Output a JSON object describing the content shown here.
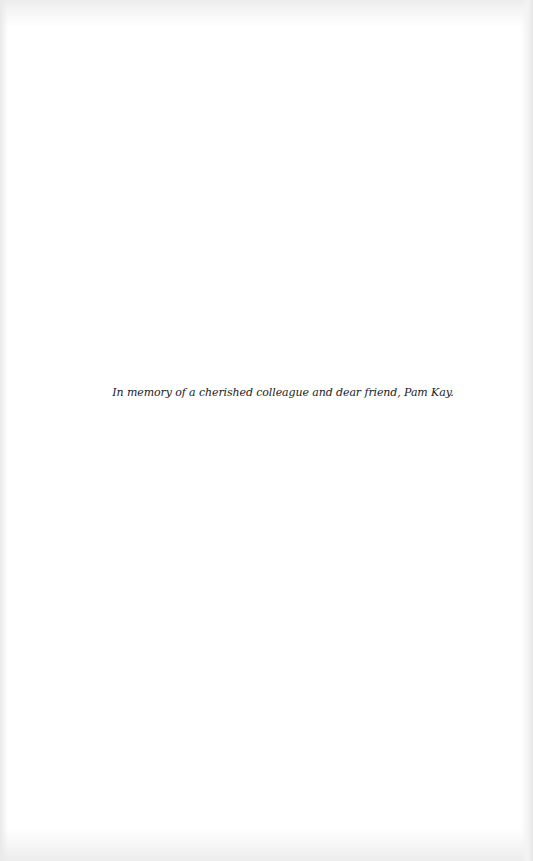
{
  "page": {
    "background_color": "#ffffff",
    "text_color": "#1a1a1a",
    "dedication": "In memory of a cherished colleague and dear friend, Pam Kay."
  }
}
